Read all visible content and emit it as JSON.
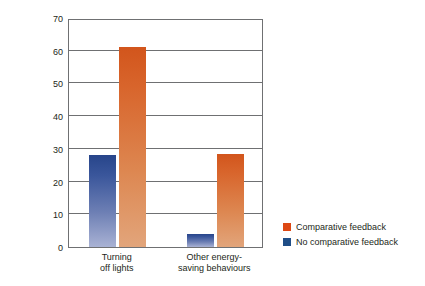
{
  "chart_data": {
    "type": "bar",
    "title": "",
    "xlabel": "",
    "ylabel": "Percentage improvement",
    "ylim": [
      0,
      70
    ],
    "ytick_labels": [
      "70",
      "60",
      "50",
      "40",
      "30",
      "20",
      "10",
      "0"
    ],
    "ytick_values": [
      70,
      60,
      50,
      40,
      30,
      20,
      10,
      0
    ],
    "grid": true,
    "legend_position": "right",
    "categories": [
      "Turning\noff lights",
      "Other energy-\nsaving behaviours"
    ],
    "series": [
      {
        "name": "No comparative feedback",
        "color": "#1f4e87",
        "values": [
          28,
          4
        ]
      },
      {
        "name": "Comparative feedback",
        "color": "#dd4814",
        "values": [
          61,
          28.5
        ]
      }
    ],
    "series_draw_order": [
      "No comparative feedback",
      "Comparative feedback"
    ]
  },
  "axis": {
    "y_title": "Percentage improvement",
    "ticks": [
      {
        "label": "70",
        "value": 70
      },
      {
        "label": "60",
        "value": 60
      },
      {
        "label": "50",
        "value": 50
      },
      {
        "label": "40",
        "value": 40
      },
      {
        "label": "30",
        "value": 30
      },
      {
        "label": "20",
        "value": 20
      },
      {
        "label": "10",
        "value": 10
      },
      {
        "label": "0",
        "value": 0
      }
    ],
    "x_groups": [
      {
        "label": "Turning\noff lights"
      },
      {
        "label": "Other energy-\nsaving behaviours"
      }
    ]
  },
  "legend": {
    "items": [
      {
        "label": "Comparative feedback",
        "color": "#dd4814",
        "swatch_name": "legend-swatch-comparative"
      },
      {
        "label": "No comparative feedback",
        "color": "#1f4e87",
        "swatch_name": "legend-swatch-no-comparative"
      }
    ]
  }
}
